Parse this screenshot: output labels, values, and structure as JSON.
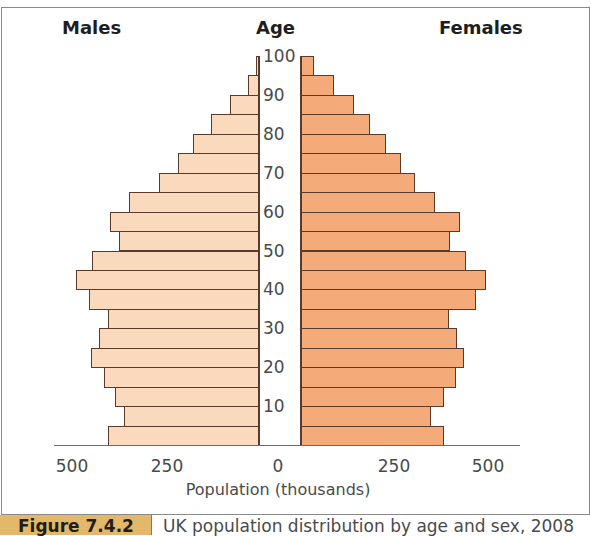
{
  "header": {
    "left": "Males",
    "center": "Age",
    "right": "Females"
  },
  "x_axis": {
    "ticks": [
      "500",
      "250",
      "0",
      "250",
      "500"
    ],
    "label": "Population (thousands)"
  },
  "age_ticks": [
    "100",
    "90",
    "80",
    "70",
    "60",
    "50",
    "40",
    "30",
    "20",
    "10"
  ],
  "caption": {
    "label": "Figure 7.4.2",
    "text": "UK population distribution by age and sex, 2008"
  },
  "colors": {
    "male": "#fbd9bd",
    "female": "#f5aa7a",
    "outline": "#5a3a2a",
    "caption_box": "#e3b86a"
  },
  "chart_data": {
    "type": "bar",
    "subtype": "population_pyramid",
    "title": "UK population distribution by age and sex, 2008",
    "xlabel": "Population (thousands)",
    "ylabel": "Age",
    "xlim": [
      -500,
      500
    ],
    "x_ticks": [
      500,
      250,
      0,
      250,
      500
    ],
    "y_ticks": [
      10,
      20,
      30,
      40,
      50,
      60,
      70,
      80,
      90,
      100
    ],
    "categories": [
      "0-4",
      "5-9",
      "10-14",
      "15-19",
      "20-24",
      "25-29",
      "30-34",
      "35-39",
      "40-44",
      "45-49",
      "50-54",
      "55-59",
      "60-64",
      "65-69",
      "70-74",
      "75-79",
      "80-84",
      "85-89",
      "90-94",
      "95-99"
    ],
    "series": [
      {
        "name": "Males",
        "side": "left",
        "color": "#fbd9bd",
        "values": [
          400,
          358,
          382,
          411,
          445,
          424,
          400,
          450,
          484,
          442,
          371,
          395,
          345,
          266,
          216,
          176,
          130,
          80,
          32,
          11
        ]
      },
      {
        "name": "Females",
        "side": "right",
        "color": "#f5aa7a",
        "values": [
          379,
          345,
          379,
          410,
          431,
          413,
          392,
          463,
          489,
          436,
          394,
          421,
          355,
          302,
          266,
          226,
          184,
          142,
          89,
          37
        ]
      }
    ],
    "legend": [
      "Males",
      "Females"
    ],
    "grid": false
  }
}
